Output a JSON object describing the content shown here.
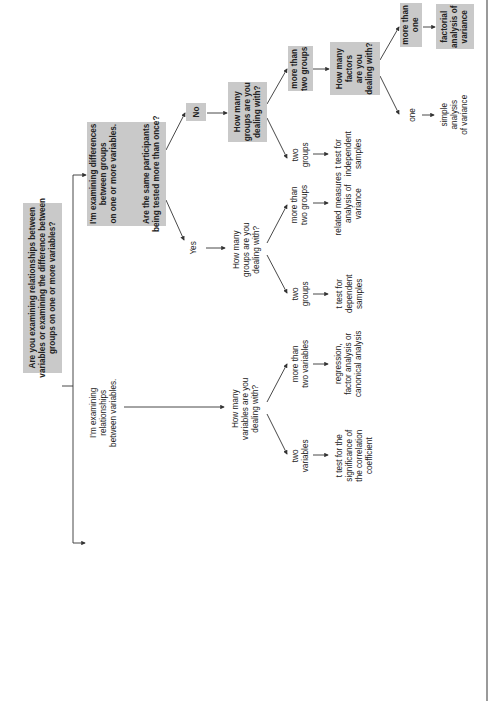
{
  "diagram": {
    "orientation": "rotated-90-ccw",
    "colors": {
      "box_fill": "#c9c9c9",
      "line": "#333333",
      "page_edge": "#9a9a9a",
      "background": "#ffffff"
    },
    "root": {
      "text": "Are you examining relationships between\nvariables or examining the difference between\ngroups on one or more variables?"
    },
    "differences_branch": {
      "statement": "I'm examining differences\nbetween groups\non one or more variables.",
      "question": "Are the same participants\nbeing tested more than once?",
      "no": {
        "label": "No",
        "question": "How many\ngroups are you\ndealing with?",
        "two_groups": {
          "label": "two\ngroups",
          "result": "t test for\nindependent\nsamples"
        },
        "more_than_two": {
          "label": "more than\ntwo groups",
          "question": "How many\nfactors\nare you\ndealing with?",
          "one": {
            "label": "one",
            "result": "simple\nanalysis\nof variance"
          },
          "more_than_one": {
            "label": "more than\none",
            "result": "factorial\nanalysis of\nvariance"
          }
        }
      },
      "yes": {
        "label": "Yes",
        "question": "How many\ngroups are you\ndealing with?",
        "two_groups": {
          "label": "two\ngroups",
          "result": "t test for\ndependent\nsamples"
        },
        "more_than_two": {
          "label": "more than\ntwo groups",
          "result": "related measures\nanalysis of\nvariance"
        }
      }
    },
    "relationships_branch": {
      "statement": "I'm examining\nrelationships\nbetween variables.",
      "question": "How many\nvariables are you\ndealing with?",
      "two_variables": {
        "label": "two\nvariables",
        "result": "t test for the\nsignificance of\nthe correlation\ncoefficient"
      },
      "more_than_two": {
        "label": "more than\ntwo variables",
        "result": "regression,\nfactor analysis or\ncanonical analysis"
      }
    }
  }
}
